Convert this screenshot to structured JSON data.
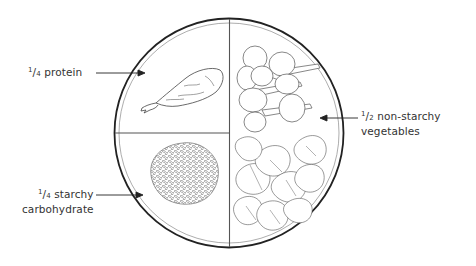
{
  "diagram": {
    "sections": [
      {
        "id": "protein",
        "fraction_num": "1",
        "fraction_den": "4",
        "label_line1": "protein",
        "label_line2": "",
        "food": "chicken-drumstick"
      },
      {
        "id": "starchy",
        "fraction_num": "1",
        "fraction_den": "4",
        "label_line1": "starchy",
        "label_line2": "carbohydrate",
        "food": "rice"
      },
      {
        "id": "vegetables",
        "fraction_num": "1",
        "fraction_den": "2",
        "label_line1": "non-starchy",
        "label_line2": "vegetables",
        "food": "broccoli-and-spinach"
      }
    ],
    "colors": {
      "line": "#2b2b2b",
      "inner_rim": "#7a7a7a",
      "background": "#ffffff"
    }
  }
}
